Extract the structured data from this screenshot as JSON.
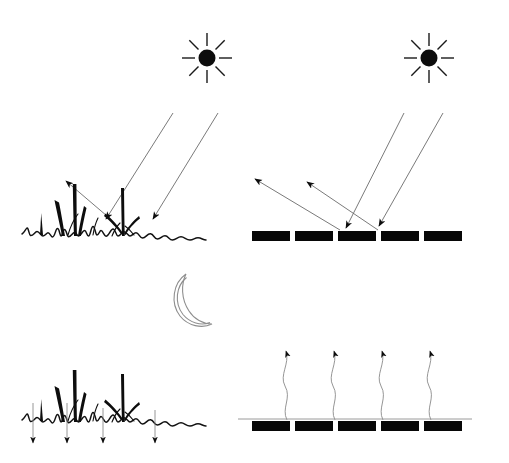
{
  "figure": {
    "width": 509,
    "height": 463,
    "background_color": "#ffffff",
    "ink_color": "#0d0d0d",
    "ray_color": "#6b6b6b",
    "moon_color": "#8e8e8e",
    "panel_color": "#070707"
  },
  "quadrants": [
    {
      "id": "top-left",
      "name": "daytime-vegetation",
      "surface": "vegetation",
      "time_of_day": "day",
      "celestial_body": "sun",
      "incoming_rays": 2,
      "reflected_rays": 1,
      "caption": ""
    },
    {
      "id": "top-right",
      "name": "daytime-solar-panels",
      "surface": "solar-panel-array",
      "time_of_day": "day",
      "celestial_body": "sun",
      "incoming_rays": 2,
      "reflected_rays": 2,
      "caption": ""
    },
    {
      "id": "bottom-left",
      "name": "nighttime-vegetation",
      "surface": "vegetation",
      "time_of_day": "night",
      "celestial_body": "moon",
      "downward_arrows": 4,
      "caption": ""
    },
    {
      "id": "bottom-right",
      "name": "nighttime-solar-panels",
      "surface": "solar-panel-array",
      "time_of_day": "night",
      "celestial_body": "moon",
      "upward_heat_plumes": 4,
      "caption": ""
    }
  ],
  "sun_top_left": {
    "icon": "sun-icon",
    "center_x": 207,
    "center_y": 58,
    "core_radius": 8.5,
    "ray_count": 8,
    "ray_inner": 12,
    "ray_outer": 25
  },
  "sun_top_right": {
    "icon": "sun-icon",
    "center_x": 429,
    "center_y": 58,
    "core_radius": 8.5,
    "ray_count": 8,
    "ray_inner": 12,
    "ray_outer": 25
  },
  "moon": {
    "icon": "moon-crescent-icon",
    "center_x": 196,
    "center_y": 299,
    "radius": 26,
    "style": "outline-crescent"
  },
  "panels_day": {
    "count": 5,
    "x_start": 252,
    "y": 231,
    "bar_width": 38,
    "bar_height": 10,
    "gap": 5
  },
  "panels_night": {
    "count": 5,
    "x_start": 252,
    "y": 421,
    "bar_width": 38,
    "bar_height": 10,
    "gap": 5,
    "ground_line_y": 419,
    "ground_x1": 238,
    "ground_x2": 472
  },
  "incoming_rays_left": [
    {
      "x1": 173,
      "y1": 113,
      "x2": 106,
      "y2": 219,
      "label": "incident-solar-ray-1"
    },
    {
      "x1": 218,
      "y1": 113,
      "x2": 153,
      "y2": 219,
      "label": "incident-solar-ray-2"
    }
  ],
  "reflected_rays_left": [
    {
      "x1": 107,
      "y1": 215,
      "x2": 65,
      "y2": 180,
      "label": "reflected-ray-1"
    }
  ],
  "incoming_rays_right": [
    {
      "x1": 404,
      "y1": 113,
      "x2": 345,
      "y2": 228,
      "label": "incident-solar-ray-1"
    },
    {
      "x1": 443,
      "y1": 113,
      "x2": 378,
      "y2": 226,
      "label": "incident-solar-ray-2"
    }
  ],
  "reflected_rays_right": [
    {
      "x1": 340,
      "y1": 229,
      "x2": 254,
      "y2": 178,
      "label": "reflected-ray-1"
    },
    {
      "x1": 378,
      "y1": 229,
      "x2": 306,
      "y2": 181,
      "label": "reflected-ray-2"
    }
  ],
  "night_down_arrows": [
    {
      "x": 33,
      "y1": 403,
      "y2": 443,
      "label": "dew-condensation-arrow-1"
    },
    {
      "x": 67,
      "y1": 403,
      "y2": 443,
      "label": "dew-condensation-arrow-2"
    },
    {
      "x": 103,
      "y1": 408,
      "y2": 443,
      "label": "dew-condensation-arrow-3"
    },
    {
      "x": 155,
      "y1": 410,
      "y2": 443,
      "label": "dew-condensation-arrow-4"
    }
  ],
  "night_heat_plumes": [
    {
      "x": 286,
      "y_base": 420,
      "y_tip": 348,
      "label": "heat-plume-1"
    },
    {
      "x": 334,
      "y_base": 420,
      "y_tip": 348,
      "label": "heat-plume-2"
    },
    {
      "x": 382,
      "y_base": 420,
      "y_tip": 348,
      "label": "heat-plume-3"
    },
    {
      "x": 430,
      "y_base": 420,
      "y_tip": 348,
      "label": "heat-plume-4"
    }
  ],
  "vegetation_day": {
    "label": "grass-canopy-day",
    "soil_path": "M22,234 L27,228 L30,236 L37,232 L43,236 L48,233 L52,237 L57,229 L60,236 L64,230 L68,237 L74,233 L78,236 L84,231 L88,236 L93,227 L97,235 L101,231 L106,236 L113,229 L118,236 L124,232 L130,236 L136,233 L142,238 L150,234 L157,239 L165,236 L172,240 L181,237 L190,240 L198,238 L206,240",
    "blade_count": 9
  },
  "vegetation_night": {
    "label": "grass-canopy-night",
    "soil_path": "M22,420 L27,414 L30,422 L37,418 L43,422 L48,419 L52,423 L57,415 L60,422 L64,416 L68,423 L74,419 L78,422 L84,417 L88,422 L93,413 L97,421 L101,417 L106,422 L113,415 L118,422 L124,418 L130,422 L136,419 L142,424 L150,420 L157,425 L165,422 L172,426 L181,423 L190,426 L198,424 L206,426",
    "blade_count": 9
  }
}
